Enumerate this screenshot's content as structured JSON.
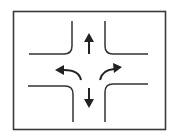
{
  "diagram": {
    "colors": {
      "background": "#ffffff",
      "frame": "#3a3a3a",
      "road": "#333333",
      "arrow": "#222222"
    },
    "arrows": [
      "up",
      "down",
      "left-turn",
      "right-turn"
    ]
  }
}
